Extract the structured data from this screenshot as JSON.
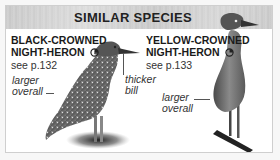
{
  "header": {
    "title": "SIMILAR SPECIES"
  },
  "species": [
    {
      "name_line1": "BLACK-CROWNED",
      "name_line2": "NIGHT-HERON",
      "season_icon": "partial-circle-icon",
      "page_ref": "see p.132",
      "notes": [
        {
          "line1": "larger",
          "line2": "overall"
        },
        {
          "line1": "thicker",
          "line2": "bill"
        }
      ]
    },
    {
      "name_line1": "YELLOW-CROWNED",
      "name_line2": "NIGHT-HERON",
      "season_icon": "partial-circle-icon",
      "page_ref": "see p.133",
      "notes": [
        {
          "line1": "larger",
          "line2": "overall"
        }
      ]
    }
  ],
  "colors": {
    "panel_border": "#cfcfcf",
    "header_bg": "#cbcbcb",
    "text": "#1a1a1a"
  }
}
